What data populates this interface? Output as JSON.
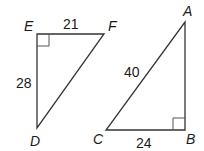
{
  "triangles": [
    {
      "name": "DEF",
      "vertices": {
        "E": "E",
        "F": "F",
        "D": "D"
      },
      "right_angle_at": "E",
      "sides": {
        "EF": "21",
        "ED": "28"
      }
    },
    {
      "name": "ABC",
      "vertices": {
        "A": "A",
        "B": "B",
        "C": "C"
      },
      "right_angle_at": "B",
      "sides": {
        "AC": "40",
        "CB": "24"
      }
    }
  ],
  "colors": {
    "stroke": "#333333",
    "text": "#1a1a1a"
  }
}
